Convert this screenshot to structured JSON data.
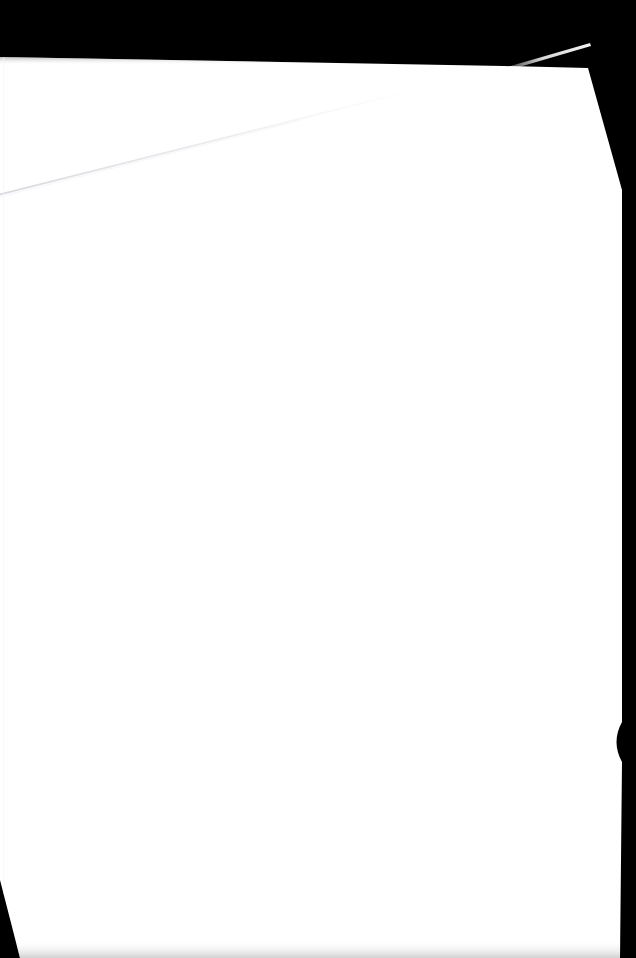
{
  "document": {
    "kind": "scanned-page",
    "surface_state": "blank",
    "page_text": "",
    "page_color": "#ffffff",
    "backdrop_color": "#000000",
    "shadow_color": "#d8d8d8",
    "crease_color": "#e6e6ea",
    "highlight_color": "#f2f2f2"
  },
  "geometry": {
    "width": 636,
    "height": 958,
    "top_edge_left_y": 57,
    "top_edge_right_y": 68,
    "left_edge_x": 0,
    "right_edge_x": 620,
    "bottom_edge_y": 958,
    "corner_cut_start_x": 588,
    "corner_cut_end_y": 190,
    "notch_top_y": 722,
    "notch_bottom_y": 762,
    "notch_depth_x": 611,
    "wedge_start_y": 880,
    "wedge_end_x": 20
  },
  "marks": {
    "crease": {
      "name": "fold-crease",
      "start_x": 0,
      "start_y": 192,
      "end_x": 408,
      "end_y": 90
    },
    "corner_highlight": {
      "name": "curled-corner-highlight",
      "start_x": 504,
      "start_y": 68,
      "end_x": 590,
      "end_y": 43
    }
  }
}
